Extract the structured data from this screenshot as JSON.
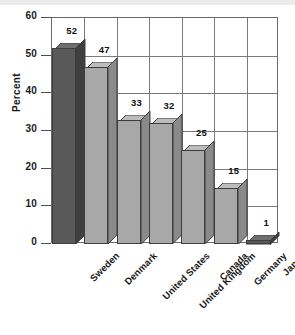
{
  "chart_data": {
    "type": "bar",
    "title": "",
    "subtitle": "",
    "xlabel": "",
    "ylabel": "Percent",
    "ylim": [
      0,
      60
    ],
    "ytick_step": 10,
    "yticks": [
      "0",
      "10",
      "20",
      "30",
      "40",
      "50",
      "60"
    ],
    "grid": true,
    "legend": null,
    "style": "3d-bars",
    "categories": [
      "Sweden",
      "Denmark",
      "United States",
      "United Kingdom",
      "Canada",
      "Germany",
      "Japan"
    ],
    "values": [
      52,
      47,
      33,
      32,
      25,
      15,
      1
    ],
    "value_labels": [
      "52",
      "47",
      "33",
      "32",
      "25",
      "15",
      "1"
    ],
    "bar_colors": [
      "#595959",
      "#a8a8a8",
      "#a8a8a8",
      "#a8a8a8",
      "#a8a8a8",
      "#a8a8a8",
      "#595959"
    ],
    "bar_top_colors": [
      "#6e6e6e",
      "#bcbcbc",
      "#bcbcbc",
      "#bcbcbc",
      "#bcbcbc",
      "#bcbcbc",
      "#6e6e6e"
    ],
    "bar_side_colors": [
      "#3f3f3f",
      "#8a8a8a",
      "#8a8a8a",
      "#8a8a8a",
      "#8a8a8a",
      "#8a8a8a",
      "#3f3f3f"
    ]
  },
  "colors": {
    "background": "#ffffff",
    "axis": "#6b6b6b",
    "grid": "#7a7a7a",
    "text": "#1a1a1a",
    "bar_light": "#a8a8a8",
    "bar_dark": "#595959"
  }
}
